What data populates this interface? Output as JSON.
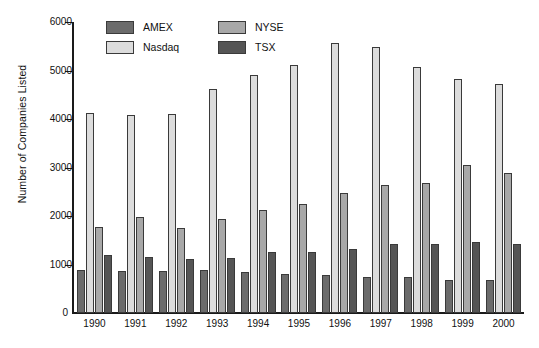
{
  "chart_data": {
    "type": "bar",
    "title": "",
    "xlabel": "",
    "ylabel": "Number of Companies Listed",
    "ylim": [
      0,
      6000
    ],
    "yticks": [
      0,
      1000,
      2000,
      3000,
      4000,
      5000,
      6000
    ],
    "ytick_labels": [
      "0",
      "1000",
      "2000",
      "3000",
      "4000",
      "5000",
      "6000"
    ],
    "grid": false,
    "legend_position": "top-left-inside",
    "categories": [
      "1990",
      "1991",
      "1992",
      "1993",
      "1994",
      "1995",
      "1996",
      "1997",
      "1998",
      "1999",
      "2000"
    ],
    "series": [
      {
        "name": "AMEX",
        "color": "#6b6b6b",
        "values": [
          880,
          860,
          860,
          890,
          840,
          810,
          790,
          750,
          740,
          680,
          680
        ]
      },
      {
        "name": "Nasdaq",
        "color": "#dcdcdc",
        "values": [
          4130,
          4090,
          4110,
          4610,
          4900,
          5120,
          5560,
          5490,
          5070,
          4830,
          4730
        ]
      },
      {
        "name": "NYSE",
        "color": "#a8a8a8",
        "values": [
          1770,
          1990,
          1750,
          1940,
          2130,
          2240,
          2480,
          2640,
          2690,
          3050,
          2880
        ]
      },
      {
        "name": "TSX",
        "color": "#555555",
        "values": [
          1200,
          1150,
          1120,
          1130,
          1250,
          1260,
          1320,
          1420,
          1430,
          1470,
          1430
        ]
      }
    ]
  },
  "axis": {
    "y_title": "Number of Companies Listed",
    "zero_label": "0"
  }
}
